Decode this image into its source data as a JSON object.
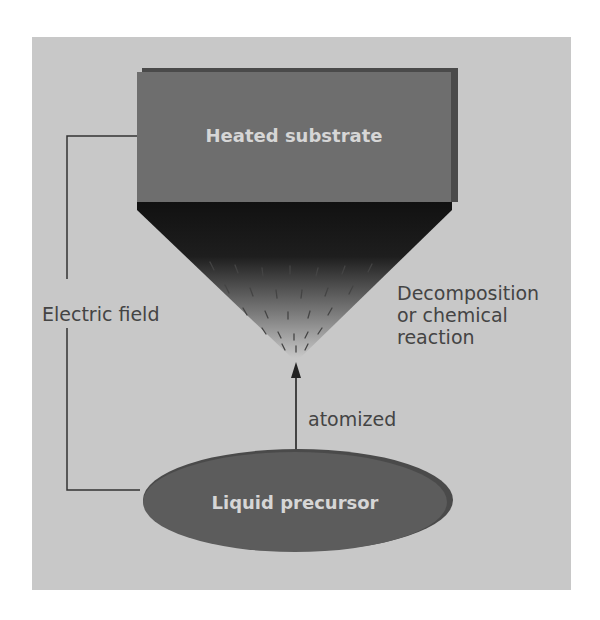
{
  "diagram": {
    "substrate_label": "Heated substrate",
    "precursor_label": "Liquid precursor",
    "field_label": "Electric field",
    "reaction_label_lines": [
      "Decomposition",
      "or chemical",
      "reaction"
    ],
    "arrow_label": "atomized"
  },
  "colors": {
    "background": "#c8c8c8",
    "substrate": "#6e6e6e",
    "precursor": "#5c5c5c",
    "cone_top": "#111111",
    "text": "#444444",
    "inner_text": "#d6d6d6"
  }
}
